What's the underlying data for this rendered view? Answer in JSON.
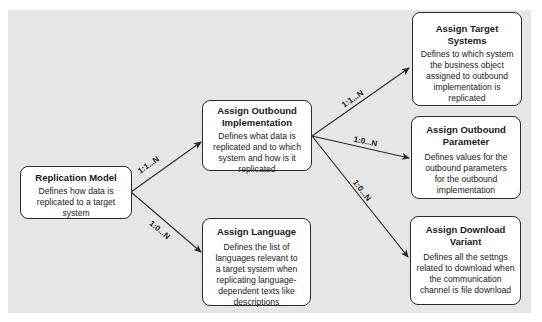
{
  "nodes": {
    "replication_model": {
      "title": "Replication Model",
      "desc": "Defines how data is replicated to a target system"
    },
    "outbound_implementation": {
      "title": "Assign Outbound Implementation",
      "desc": "Defines what data is replicated and to which system and how is it replicated"
    },
    "language": {
      "title": "Assign Language",
      "desc": "Defines the list of languages relevant to a target system when replicating language-dependent texts like descriptions"
    },
    "target_systems": {
      "title": "Assign Target Systems",
      "desc": "Defines to which system the business object assigned to outbound implementation is replicated"
    },
    "outbound_parameter": {
      "title": "Assign Outbound Parameter",
      "desc": "Defines values for the outbound parameters for the outbound implementation"
    },
    "download_variant": {
      "title": "Assign Download Variant",
      "desc": "Defines all the settngs related to download when the communication channel is file download"
    }
  },
  "edges": [
    {
      "from": "Replication Model",
      "to": "Assign Outbound Implementation",
      "label": "1:1...N"
    },
    {
      "from": "Replication Model",
      "to": "Assign Language",
      "label": "1:0...N"
    },
    {
      "from": "Assign Outbound Implementation",
      "to": "Assign Target Systems",
      "label": "1:1...N"
    },
    {
      "from": "Assign Outbound Implementation",
      "to": "Assign Outbound Parameter",
      "label": "1:0...N"
    },
    {
      "from": "Assign Outbound Implementation",
      "to": "Assign Download Variant",
      "label": "1:0...N"
    }
  ],
  "colors": {
    "panel_bg": "#e6e6e6",
    "box_bg": "#ffffff",
    "stroke": "#2b2b2b"
  }
}
